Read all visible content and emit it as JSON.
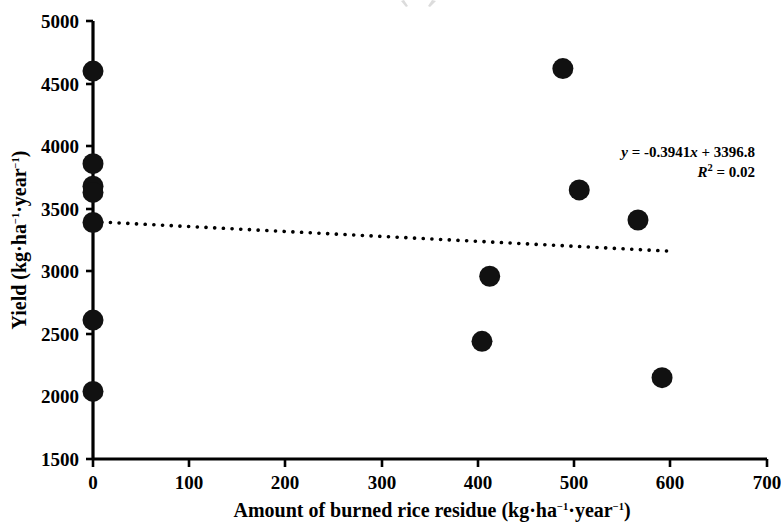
{
  "chart_data": {
    "type": "scatter",
    "title": "",
    "xlabel": "Amount of burned rice residue (kg·ha−1·year−1)",
    "ylabel": "Yield (kg·ha−1·year−1)",
    "xlim": [
      0,
      700
    ],
    "ylim": [
      1500,
      5000
    ],
    "xticks": [
      0,
      100,
      200,
      300,
      400,
      500,
      600,
      700
    ],
    "yticks": [
      1500,
      2000,
      2500,
      3000,
      3500,
      4000,
      4500,
      5000
    ],
    "xtick_labels": [
      "0",
      "100",
      "200",
      "300",
      "400",
      "500",
      "600",
      "700"
    ],
    "ytick_labels": [
      "1500",
      "2000",
      "2500",
      "3000",
      "3500",
      "4000",
      "4500",
      "5000"
    ],
    "grid": false,
    "legend": null,
    "marker": "filled-circle",
    "marker_color": "#111111",
    "points": [
      {
        "x": 0,
        "y": 4600
      },
      {
        "x": 0,
        "y": 3860
      },
      {
        "x": 0,
        "y": 3680
      },
      {
        "x": 0,
        "y": 3630
      },
      {
        "x": 0,
        "y": 3390
      },
      {
        "x": 0,
        "y": 2610
      },
      {
        "x": 0,
        "y": 2040
      },
      {
        "x": 488,
        "y": 4620
      },
      {
        "x": 505,
        "y": 3650
      },
      {
        "x": 566,
        "y": 3410
      },
      {
        "x": 412,
        "y": 2960
      },
      {
        "x": 404,
        "y": 2440
      },
      {
        "x": 591,
        "y": 2150
      }
    ],
    "trendline": {
      "style": "dotted",
      "color": "#000000",
      "slope": -0.3941,
      "intercept": 3396.8,
      "x_start": 0,
      "x_end": 597,
      "y_start": 3396.8,
      "y_end": 3161.5
    },
    "annotations": {
      "equation_y": "y",
      "equation_body": " = -0.3941",
      "equation_x": "x",
      "equation_tail": " + 3396.8",
      "r_symbol": "R",
      "r_exponent": "2",
      "r_value": " = 0.02"
    }
  },
  "axes": {
    "x_label_main": "Amount of burned rice residue (kg·ha",
    "x_label_sup1": "−1",
    "x_label_mid": "·year",
    "x_label_sup2": "−1",
    "x_label_end": ")",
    "y_label_main": "Yield (kg·ha",
    "y_label_sup1": "−1",
    "y_label_mid": "·year",
    "y_label_sup2": "−1",
    "y_label_end": ")"
  }
}
